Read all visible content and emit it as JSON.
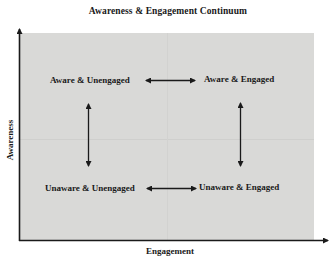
{
  "diagram": {
    "title": "Awareness & Engagement Continuum",
    "x_axis_label": "Engagement",
    "y_axis_label": "Awareness",
    "quadrants": {
      "top_left": "Aware & Unengaged",
      "top_right": "Aware & Engaged",
      "bottom_left": "Unaware & Unengaged",
      "bottom_right": "Unaware & Engaged"
    },
    "connections": [
      {
        "from": "Aware & Unengaged",
        "to": "Aware & Engaged",
        "type": "bidirectional"
      },
      {
        "from": "Unaware & Unengaged",
        "to": "Unaware & Engaged",
        "type": "bidirectional"
      },
      {
        "from": "Aware & Unengaged",
        "to": "Unaware & Unengaged",
        "type": "bidirectional"
      },
      {
        "from": "Aware & Engaged",
        "to": "Unaware & Engaged",
        "type": "bidirectional"
      }
    ],
    "colors": {
      "panel": "#d9d9d7",
      "ink": "#1a1a1a",
      "background": "#ffffff"
    }
  }
}
